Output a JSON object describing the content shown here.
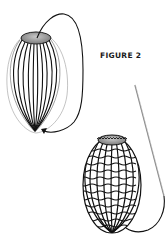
{
  "figure": {
    "label": "FIGURE 2",
    "colors": {
      "ink": "#111111",
      "rim_fill": "#8a8a8a",
      "rim_highlight": "#c8c8c8",
      "needle": "#999999",
      "background": "#ffffff"
    },
    "elements": [
      "ribbed-egg-form",
      "looping-thread-with-arrow",
      "netted-egg-form",
      "sewing-needle-with-thread"
    ]
  }
}
